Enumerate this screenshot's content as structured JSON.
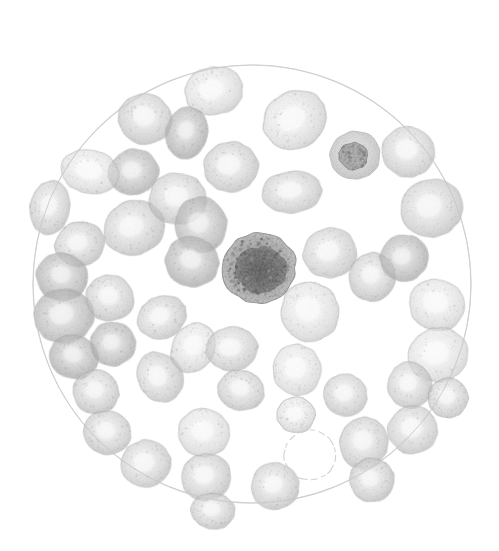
{
  "figure": {
    "caption": "Abb. 2.",
    "kind": "photomicrograph-illustration",
    "background_color": "#ffffff",
    "ink_color": "#1a1a1a"
  },
  "field": {
    "name": "microscope-field-circle",
    "cx": 252,
    "cy": 284,
    "r": 219,
    "stroke_color": "#d9d9d9",
    "stroke_width": 1.1,
    "fill_color": "#ffffff"
  },
  "palette": {
    "erythrocyte_edge": "#b9b9b9",
    "erythrocyte_body": "#d6d6d6",
    "erythrocyte_center": "#f2f2f2",
    "erythrocyte_dark": "#a8a8a8",
    "leukocyte_rim": "#9a9a9a",
    "leukocyte_nucleus": "#6e6e6e",
    "lymphocyte_rim": "#bcbcbc",
    "lymphocyte_nucleus": "#8a8a8a",
    "ghost_outline": "#cfcfcf"
  },
  "legend": {
    "erythrocyte_label": "erythrocyte",
    "leukocyte_label": "leukocyte",
    "lymphocyte_label": "lymphocyte",
    "ghost_label": "unstained cell outline"
  },
  "counts": {
    "erythrocytes": 48,
    "leukocytes": 1,
    "lymphocytes": 1,
    "ghost_outlines": 1
  },
  "cells": [
    {
      "id": 1,
      "type": "erythrocyte",
      "cx": 214,
      "cy": 91,
      "rx": 29,
      "ry": 24,
      "rot": -12,
      "tone": 0.52,
      "pallor": 0.6
    },
    {
      "id": 2,
      "type": "erythrocyte",
      "cx": 145,
      "cy": 119,
      "rx": 27,
      "ry": 25,
      "rot": 20,
      "tone": 0.58,
      "pallor": 0.5
    },
    {
      "id": 3,
      "type": "erythrocyte",
      "cx": 134,
      "cy": 172,
      "rx": 25,
      "ry": 23,
      "rot": -8,
      "tone": 0.66,
      "pallor": 0.4
    },
    {
      "id": 4,
      "type": "erythrocyte",
      "cx": 187,
      "cy": 133,
      "rx": 21,
      "ry": 26,
      "rot": 12,
      "tone": 0.7,
      "pallor": 0.34
    },
    {
      "id": 5,
      "type": "erythrocyte",
      "cx": 231,
      "cy": 167,
      "rx": 27,
      "ry": 25,
      "rot": -5,
      "tone": 0.58,
      "pallor": 0.55
    },
    {
      "id": 6,
      "type": "erythrocyte",
      "cx": 295,
      "cy": 120,
      "rx": 33,
      "ry": 28,
      "rot": -28,
      "tone": 0.62,
      "pallor": 0.58
    },
    {
      "id": 7,
      "type": "erythrocyte",
      "cx": 292,
      "cy": 192,
      "rx": 30,
      "ry": 21,
      "rot": -4,
      "tone": 0.52,
      "pallor": 0.5
    },
    {
      "id": 8,
      "type": "lymphocyte",
      "cx": 355,
      "cy": 155,
      "rx": 25,
      "ry": 24,
      "rot": 0,
      "tone": 0.55,
      "pallor": 0.2
    },
    {
      "id": 9,
      "type": "erythrocyte",
      "cx": 408,
      "cy": 152,
      "rx": 26,
      "ry": 25,
      "rot": 10,
      "tone": 0.5,
      "pallor": 0.52
    },
    {
      "id": 10,
      "type": "erythrocyte",
      "cx": 432,
      "cy": 208,
      "rx": 31,
      "ry": 29,
      "rot": -14,
      "tone": 0.56,
      "pallor": 0.48
    },
    {
      "id": 11,
      "type": "erythrocyte",
      "cx": 90,
      "cy": 172,
      "rx": 29,
      "ry": 22,
      "rot": 14,
      "tone": 0.46,
      "pallor": 0.7
    },
    {
      "id": 12,
      "type": "erythrocyte",
      "cx": 50,
      "cy": 208,
      "rx": 20,
      "ry": 27,
      "rot": 8,
      "tone": 0.56,
      "pallor": 0.45
    },
    {
      "id": 13,
      "type": "erythrocyte",
      "cx": 134,
      "cy": 228,
      "rx": 31,
      "ry": 27,
      "rot": -18,
      "tone": 0.6,
      "pallor": 0.46
    },
    {
      "id": 14,
      "type": "erythrocyte",
      "cx": 178,
      "cy": 199,
      "rx": 29,
      "ry": 26,
      "rot": 6,
      "tone": 0.56,
      "pallor": 0.5
    },
    {
      "id": 15,
      "type": "erythrocyte",
      "cx": 201,
      "cy": 225,
      "rx": 26,
      "ry": 28,
      "rot": -10,
      "tone": 0.64,
      "pallor": 0.38
    },
    {
      "id": 16,
      "type": "erythrocyte",
      "cx": 192,
      "cy": 262,
      "rx": 27,
      "ry": 25,
      "rot": 16,
      "tone": 0.68,
      "pallor": 0.42
    },
    {
      "id": 17,
      "type": "leukocyte",
      "cx": 259,
      "cy": 268,
      "rx": 37,
      "ry": 35,
      "rot": 0,
      "tone": 0.88,
      "pallor": 0.1
    },
    {
      "id": 18,
      "type": "erythrocyte",
      "cx": 80,
      "cy": 244,
      "rx": 25,
      "ry": 22,
      "rot": -14,
      "tone": 0.62,
      "pallor": 0.42
    },
    {
      "id": 19,
      "type": "erythrocyte",
      "cx": 62,
      "cy": 277,
      "rx": 26,
      "ry": 24,
      "rot": 18,
      "tone": 0.7,
      "pallor": 0.36
    },
    {
      "id": 20,
      "type": "erythrocyte",
      "cx": 330,
      "cy": 253,
      "rx": 27,
      "ry": 25,
      "rot": -6,
      "tone": 0.5,
      "pallor": 0.54
    },
    {
      "id": 21,
      "type": "erythrocyte",
      "cx": 372,
      "cy": 277,
      "rx": 23,
      "ry": 24,
      "rot": 8,
      "tone": 0.62,
      "pallor": 0.4
    },
    {
      "id": 22,
      "type": "erythrocyte",
      "cx": 404,
      "cy": 258,
      "rx": 24,
      "ry": 23,
      "rot": -12,
      "tone": 0.68,
      "pallor": 0.38
    },
    {
      "id": 23,
      "type": "erythrocyte",
      "cx": 437,
      "cy": 305,
      "rx": 28,
      "ry": 26,
      "rot": 14,
      "tone": 0.48,
      "pallor": 0.62
    },
    {
      "id": 24,
      "type": "erythrocyte",
      "cx": 64,
      "cy": 316,
      "rx": 30,
      "ry": 27,
      "rot": -8,
      "tone": 0.64,
      "pallor": 0.44
    },
    {
      "id": 25,
      "type": "erythrocyte",
      "cx": 110,
      "cy": 298,
      "rx": 24,
      "ry": 23,
      "rot": 10,
      "tone": 0.58,
      "pallor": 0.46
    },
    {
      "id": 26,
      "type": "erythrocyte",
      "cx": 162,
      "cy": 317,
      "rx": 25,
      "ry": 21,
      "rot": -24,
      "tone": 0.56,
      "pallor": 0.52
    },
    {
      "id": 27,
      "type": "erythrocyte",
      "cx": 310,
      "cy": 312,
      "rx": 29,
      "ry": 30,
      "rot": 4,
      "tone": 0.54,
      "pallor": 0.56
    },
    {
      "id": 28,
      "type": "erythrocyte",
      "cx": 438,
      "cy": 355,
      "rx": 30,
      "ry": 27,
      "rot": -10,
      "tone": 0.46,
      "pallor": 0.64
    },
    {
      "id": 29,
      "type": "erythrocyte",
      "cx": 74,
      "cy": 357,
      "rx": 25,
      "ry": 22,
      "rot": 16,
      "tone": 0.7,
      "pallor": 0.34
    },
    {
      "id": 30,
      "type": "erythrocyte",
      "cx": 113,
      "cy": 344,
      "rx": 23,
      "ry": 22,
      "rot": -6,
      "tone": 0.66,
      "pallor": 0.36
    },
    {
      "id": 31,
      "type": "erythrocyte",
      "cx": 96,
      "cy": 392,
      "rx": 23,
      "ry": 22,
      "rot": 8,
      "tone": 0.62,
      "pallor": 0.42
    },
    {
      "id": 32,
      "type": "erythrocyte",
      "cx": 160,
      "cy": 377,
      "rx": 22,
      "ry": 26,
      "rot": -32,
      "tone": 0.54,
      "pallor": 0.52
    },
    {
      "id": 33,
      "type": "erythrocyte",
      "cx": 193,
      "cy": 348,
      "rx": 21,
      "ry": 26,
      "rot": 28,
      "tone": 0.52,
      "pallor": 0.56
    },
    {
      "id": 34,
      "type": "erythrocyte",
      "cx": 232,
      "cy": 349,
      "rx": 26,
      "ry": 22,
      "rot": -6,
      "tone": 0.5,
      "pallor": 0.54
    },
    {
      "id": 35,
      "type": "erythrocyte",
      "cx": 241,
      "cy": 390,
      "rx": 23,
      "ry": 20,
      "rot": 14,
      "tone": 0.58,
      "pallor": 0.48
    },
    {
      "id": 36,
      "type": "erythrocyte",
      "cx": 297,
      "cy": 370,
      "rx": 24,
      "ry": 26,
      "rot": -4,
      "tone": 0.46,
      "pallor": 0.62
    },
    {
      "id": 37,
      "type": "erythrocyte",
      "cx": 345,
      "cy": 395,
      "rx": 22,
      "ry": 21,
      "rot": 10,
      "tone": 0.52,
      "pallor": 0.52
    },
    {
      "id": 38,
      "type": "erythrocyte",
      "cx": 296,
      "cy": 415,
      "rx": 19,
      "ry": 18,
      "rot": 0,
      "tone": 0.5,
      "pallor": 0.56
    },
    {
      "id": 39,
      "type": "erythrocyte",
      "cx": 410,
      "cy": 385,
      "rx": 22,
      "ry": 23,
      "rot": -8,
      "tone": 0.56,
      "pallor": 0.46
    },
    {
      "id": 40,
      "type": "erythrocyte",
      "cx": 107,
      "cy": 433,
      "rx": 24,
      "ry": 22,
      "rot": 12,
      "tone": 0.6,
      "pallor": 0.44
    },
    {
      "id": 41,
      "type": "erythrocyte",
      "cx": 146,
      "cy": 464,
      "rx": 25,
      "ry": 24,
      "rot": -14,
      "tone": 0.52,
      "pallor": 0.54
    },
    {
      "id": 42,
      "type": "erythrocyte",
      "cx": 204,
      "cy": 433,
      "rx": 26,
      "ry": 24,
      "rot": 6,
      "tone": 0.5,
      "pallor": 0.56
    },
    {
      "id": 43,
      "type": "erythrocyte",
      "cx": 206,
      "cy": 477,
      "rx": 25,
      "ry": 23,
      "rot": -8,
      "tone": 0.54,
      "pallor": 0.5
    },
    {
      "id": 44,
      "type": "erythrocyte",
      "cx": 213,
      "cy": 511,
      "rx": 22,
      "ry": 18,
      "rot": 4,
      "tone": 0.58,
      "pallor": 0.44
    },
    {
      "id": 45,
      "type": "erythrocyte",
      "cx": 275,
      "cy": 486,
      "rx": 24,
      "ry": 23,
      "rot": -10,
      "tone": 0.52,
      "pallor": 0.5
    },
    {
      "id": 46,
      "type": "erythrocyte",
      "cx": 364,
      "cy": 443,
      "rx": 24,
      "ry": 26,
      "rot": 8,
      "tone": 0.58,
      "pallor": 0.46
    },
    {
      "id": 47,
      "type": "erythrocyte",
      "cx": 372,
      "cy": 480,
      "rx": 22,
      "ry": 22,
      "rot": -16,
      "tone": 0.62,
      "pallor": 0.4
    },
    {
      "id": 48,
      "type": "erythrocyte",
      "cx": 413,
      "cy": 430,
      "rx": 25,
      "ry": 24,
      "rot": 10,
      "tone": 0.5,
      "pallor": 0.54
    },
    {
      "id": 49,
      "type": "erythrocyte",
      "cx": 448,
      "cy": 398,
      "rx": 20,
      "ry": 20,
      "rot": 0,
      "tone": 0.52,
      "pallor": 0.48
    },
    {
      "id": 50,
      "type": "ghost",
      "cx": 310,
      "cy": 455,
      "rx": 26,
      "ry": 25,
      "rot": 0,
      "tone": 0.12,
      "pallor": 0.95
    }
  ]
}
